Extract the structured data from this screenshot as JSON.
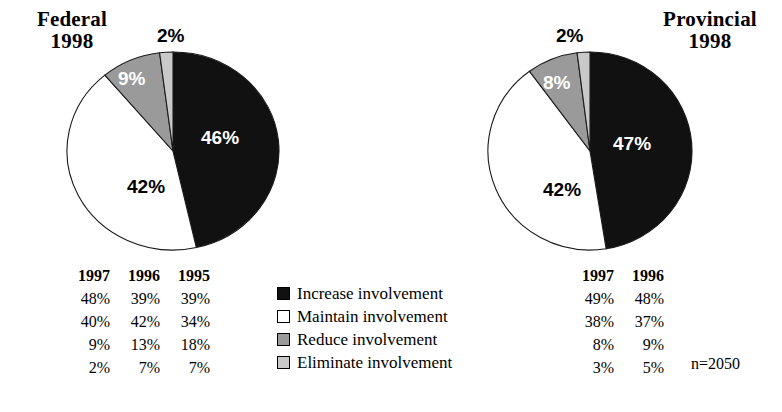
{
  "figure": {
    "sample_size_label": "n=2050"
  },
  "charts": [
    {
      "key": "federal",
      "title": "Federal",
      "year": "1998",
      "labels": [
        "46%",
        "42%",
        "9%",
        "2%"
      ]
    },
    {
      "key": "provincial",
      "title": "Provincial",
      "year": "1998",
      "labels": [
        "47%",
        "42%",
        "8%",
        "2%"
      ]
    }
  ],
  "legend": {
    "items": [
      {
        "label": "Increase involvement",
        "swatch": "black",
        "color": "#111111"
      },
      {
        "label": "Maintain involvement",
        "swatch": "white",
        "color": "#ffffff"
      },
      {
        "label": "Reduce involvement",
        "swatch": "mid",
        "color": "#9a9a9a"
      },
      {
        "label": "Eliminate involvement",
        "swatch": "light",
        "color": "#c9c9c9"
      }
    ]
  },
  "tables": {
    "federal": {
      "headers": [
        "1997",
        "1996",
        "1995"
      ],
      "rows": [
        [
          "48%",
          "39%",
          "39%"
        ],
        [
          "40%",
          "42%",
          "34%"
        ],
        [
          "9%",
          "13%",
          "18%"
        ],
        [
          "2%",
          "7%",
          "7%"
        ]
      ]
    },
    "provincial": {
      "headers": [
        "1997",
        "1996"
      ],
      "rows": [
        [
          "49%",
          "48%"
        ],
        [
          "38%",
          "37%"
        ],
        [
          "8%",
          "9%"
        ],
        [
          "3%",
          "5%"
        ]
      ]
    }
  },
  "chart_data": {
    "type": "pie",
    "categories": [
      "Increase involvement",
      "Maintain involvement",
      "Reduce involvement",
      "Eliminate involvement"
    ],
    "colors": [
      "#111111",
      "#ffffff",
      "#9a9a9a",
      "#c9c9c9"
    ],
    "sample_size": 2050,
    "legend_position": "bottom-center",
    "grid": false,
    "pies": [
      {
        "name": "Federal 1998",
        "year": 1998,
        "values": [
          46,
          42,
          9,
          2
        ],
        "start_angle_deg": 0,
        "direction": "clockwise"
      },
      {
        "name": "Provincial 1998",
        "year": 1998,
        "values": [
          47,
          42,
          8,
          2
        ],
        "start_angle_deg": 0,
        "direction": "clockwise"
      }
    ],
    "historical_series": [
      {
        "name": "Federal",
        "years": [
          "1997",
          "1996",
          "1995"
        ],
        "series": [
          {
            "name": "Increase involvement",
            "values": [
              48,
              39,
              39
            ]
          },
          {
            "name": "Maintain involvement",
            "values": [
              40,
              42,
              34
            ]
          },
          {
            "name": "Reduce involvement",
            "values": [
              9,
              13,
              18
            ]
          },
          {
            "name": "Eliminate involvement",
            "values": [
              2,
              7,
              7
            ]
          }
        ]
      },
      {
        "name": "Provincial",
        "years": [
          "1997",
          "1996"
        ],
        "series": [
          {
            "name": "Increase involvement",
            "values": [
              49,
              48
            ]
          },
          {
            "name": "Maintain involvement",
            "values": [
              38,
              37
            ]
          },
          {
            "name": "Reduce involvement",
            "values": [
              8,
              9
            ]
          },
          {
            "name": "Eliminate involvement",
            "values": [
              3,
              5
            ]
          }
        ]
      }
    ]
  }
}
